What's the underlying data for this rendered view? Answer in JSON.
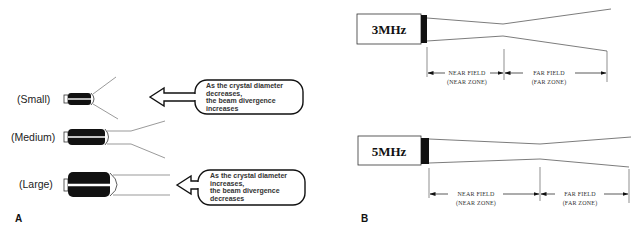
{
  "panel_a": {
    "label": "A",
    "transducers": [
      {
        "size_label": "(Small)"
      },
      {
        "size_label": "(Medium)"
      },
      {
        "size_label": "(Large)"
      }
    ],
    "callouts": [
      {
        "lines": [
          "As the crystal diameter",
          "decreases,",
          "the beam divergence",
          "increases"
        ]
      },
      {
        "lines": [
          "As the crystal diameter",
          "increases,",
          "the beam divergence",
          "decreases"
        ]
      }
    ]
  },
  "panel_b": {
    "label": "B",
    "diagrams": [
      {
        "frequency": "3MHz",
        "near_field": "NEAR FIELD",
        "near_zone": "(NEAR ZONE)",
        "far_field": "FAR FIELD",
        "far_zone": "(FAR ZONE)"
      },
      {
        "frequency": "5MHz",
        "near_field": "NEAR FIELD",
        "near_zone": "(NEAR ZONE)",
        "far_field": "FAR FIELD",
        "far_zone": "(FAR ZONE)"
      }
    ]
  },
  "colors": {
    "ink": "#111111",
    "line": "#555555",
    "background": "#ffffff"
  }
}
